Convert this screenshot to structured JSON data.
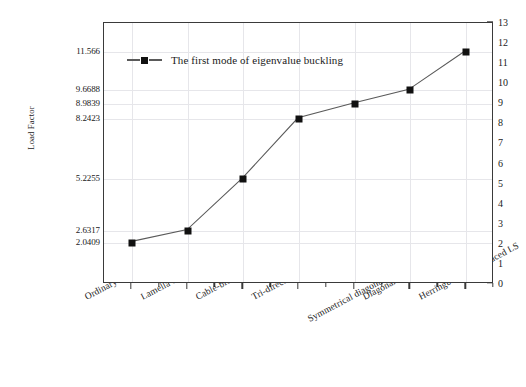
{
  "chart_data": {
    "type": "line",
    "title": "",
    "xlabel": "",
    "ylabel": "Load Factor",
    "categories": [
      "Ordinary Lattice Shell",
      "Lamella Lattice Shell",
      "Cable-braced Lattice Shell",
      "Tri-direction Lattice Shell",
      "Symmetrical diagonal strut-braced LS",
      "Diagonal strut-braced LS",
      "Herringbone strut-braced LS"
    ],
    "series": [
      {
        "name": "The first mode of eigenvalue buckling",
        "values": [
          2.0409,
          2.6317,
          5.2255,
          8.2423,
          8.9839,
          9.6688,
          11.566
        ]
      }
    ],
    "left_axis": {
      "label": "Load Factor",
      "tick_labels": [
        "2.0409",
        "2.6317",
        "5.2255",
        "8.2423",
        "8.9839",
        "9.6688",
        "11.566"
      ],
      "tick_values": [
        2.0409,
        2.6317,
        5.2255,
        8.2423,
        8.9839,
        9.6688,
        11.566
      ]
    },
    "right_axis": {
      "label": "",
      "tick_labels": [
        "0",
        "1",
        "2",
        "3",
        "4",
        "5",
        "6",
        "7",
        "8",
        "9",
        "10",
        "11",
        "12",
        "13"
      ],
      "tick_values": [
        0,
        1,
        2,
        3,
        4,
        5,
        6,
        7,
        8,
        9,
        10,
        11,
        12,
        13
      ],
      "range": [
        0,
        13
      ]
    },
    "ylim": [
      0,
      13
    ],
    "grid": true,
    "legend": {
      "position": "top-left-inside",
      "entries": [
        "The first mode of eigenvalue buckling"
      ]
    },
    "colors": {
      "marker": "#111111",
      "line": "#5a5a5a",
      "axis": "#3a3a3a",
      "grid": "#e6e6ea",
      "background": "#ffffff"
    }
  }
}
